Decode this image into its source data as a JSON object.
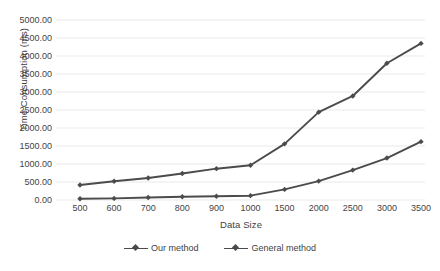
{
  "chart_data": {
    "type": "line",
    "title": "",
    "xlabel": "Data Size",
    "ylabel": "Time Consumption (ms)",
    "categories": [
      "500",
      "600",
      "700",
      "800",
      "900",
      "1000",
      "1500",
      "2000",
      "2500",
      "3000",
      "3500"
    ],
    "ylim": [
      0,
      5000
    ],
    "ytick_labels": [
      "5000.00",
      "4500.00",
      "4000.00",
      "3500.00",
      "3000.00",
      "2500.00",
      "2000.00",
      "1500.00",
      "1000.00",
      "500.00",
      "0.00"
    ],
    "ytick_values": [
      5000,
      4500,
      4000,
      3500,
      3000,
      2500,
      2000,
      1500,
      1000,
      500,
      0
    ],
    "grid": "horizontal",
    "legend_position": "bottom",
    "series": [
      {
        "name": "Our method",
        "color": "#4b4b4b",
        "values": [
          35,
          45,
          70,
          90,
          105,
          120,
          295,
          525,
          830,
          1165,
          1620
        ]
      },
      {
        "name": "General method",
        "color": "#4b4b4b",
        "values": [
          415,
          520,
          610,
          735,
          870,
          965,
          1560,
          2440,
          2890,
          3800,
          4350
        ]
      }
    ]
  },
  "legend": {
    "items": [
      {
        "label": "Our method"
      },
      {
        "label": "General method"
      }
    ]
  }
}
